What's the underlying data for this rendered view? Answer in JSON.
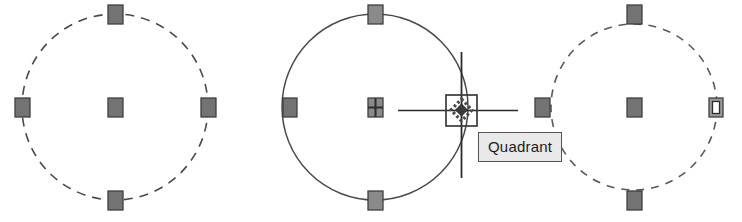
{
  "app": {
    "kind": "cad-drawing-canvas",
    "background_color": "#ffffff"
  },
  "colors": {
    "grip_fill": "#737373",
    "grip_border": "#3f3f3f",
    "grip_hot_fill": "#ffffff",
    "entity_line": "#4a4a4a",
    "cursor_line": "#2b2b2b",
    "snap_marker": "#3a3a3a",
    "tooltip_bg": "#e9e9e9",
    "tooltip_border": "#555555",
    "tooltip_text": "#1c1c1c"
  },
  "tooltip": {
    "label": "Quadrant",
    "x": 478,
    "y": 132
  },
  "cursor": {
    "name": "crosshair-cursor",
    "x": 461,
    "y": 110,
    "horizontal_span": [
      398,
      518
    ],
    "vertical_span": [
      52,
      178
    ],
    "pickbox_size": 30,
    "snap_marker_type": "quadrant-diamond"
  },
  "circles": [
    {
      "id": "circle-left",
      "cx": 115,
      "cy": 107,
      "r": 93,
      "linetype": "dashed",
      "selected": false,
      "grips": [
        {
          "name": "grip-center",
          "x": 115,
          "y": 107,
          "style": "filled"
        },
        {
          "name": "grip-quadrant-top",
          "x": 115,
          "y": 14,
          "style": "filled"
        },
        {
          "name": "grip-quadrant-right",
          "x": 208,
          "y": 107,
          "style": "filled"
        },
        {
          "name": "grip-quadrant-bottom",
          "x": 115,
          "y": 200,
          "style": "filled"
        },
        {
          "name": "grip-quadrant-left",
          "x": 22,
          "y": 107,
          "style": "filled"
        }
      ]
    },
    {
      "id": "circle-middle",
      "cx": 375,
      "cy": 107,
      "r": 93,
      "linetype": "solid",
      "selected": true,
      "grips": [
        {
          "name": "grip-center",
          "x": 375,
          "y": 107,
          "style": "move"
        },
        {
          "name": "grip-quadrant-top",
          "x": 375,
          "y": 14,
          "style": "filled"
        },
        {
          "name": "grip-quadrant-bottom",
          "x": 375,
          "y": 200,
          "style": "filled"
        },
        {
          "name": "grip-quadrant-left",
          "x": 290,
          "y": 107,
          "style": "filled"
        }
      ]
    },
    {
      "id": "circle-right",
      "cx": 634,
      "cy": 107,
      "r": 83,
      "linetype": "dashed",
      "selected": false,
      "grips": [
        {
          "name": "grip-center",
          "x": 634,
          "y": 107,
          "style": "filled"
        },
        {
          "name": "grip-quadrant-top",
          "x": 634,
          "y": 14,
          "style": "filled"
        },
        {
          "name": "grip-quadrant-right",
          "x": 716,
          "y": 107,
          "style": "hot"
        },
        {
          "name": "grip-quadrant-bottom",
          "x": 634,
          "y": 200,
          "style": "filled"
        },
        {
          "name": "grip-quadrant-left",
          "x": 542,
          "y": 107,
          "style": "filled"
        }
      ]
    }
  ]
}
